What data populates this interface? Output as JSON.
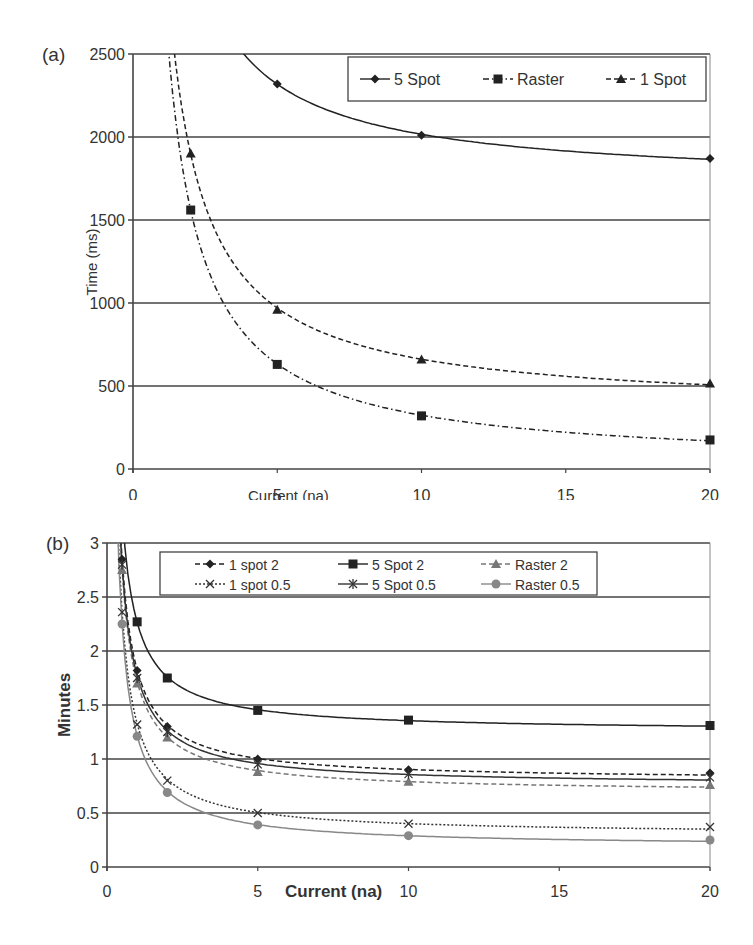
{
  "chart_data": [
    {
      "panel_label": "(a)",
      "type": "line",
      "title": "",
      "xlabel": "Current (na)",
      "ylabel": "Time (ms)",
      "xlim": [
        0,
        20
      ],
      "ylim": [
        0,
        2500
      ],
      "xticks": [
        0,
        5,
        10,
        15,
        20
      ],
      "yticks": [
        0,
        500,
        1000,
        1500,
        2000,
        2500
      ],
      "grid": "horizontal",
      "legend_position": "top-right",
      "series": [
        {
          "name": "5 Spot",
          "marker": "diamond",
          "line": "solid",
          "x": [
            5,
            10,
            20
          ],
          "values": [
            2320,
            2010,
            1870
          ]
        },
        {
          "name": "Raster",
          "marker": "square",
          "line": "dashdot",
          "x": [
            2,
            5,
            10,
            20
          ],
          "values": [
            1560,
            630,
            320,
            175
          ]
        },
        {
          "name": "1 Spot",
          "marker": "triangle",
          "line": "dashed",
          "x": [
            2,
            5,
            10,
            20
          ],
          "values": [
            1900,
            960,
            660,
            515
          ]
        }
      ]
    },
    {
      "panel_label": "(b)",
      "type": "line",
      "title": "",
      "xlabel": "Current (na)",
      "ylabel": "Minutes",
      "xlim": [
        0,
        20
      ],
      "ylim": [
        0,
        3
      ],
      "xticks": [
        0,
        5,
        10,
        15,
        20
      ],
      "yticks": [
        0,
        0.5,
        1,
        1.5,
        2,
        2.5,
        3
      ],
      "grid": "horizontal",
      "legend_position": "top-right",
      "series": [
        {
          "name": "1 spot 2",
          "marker": "diamond",
          "line": "dashed",
          "color": "#222222",
          "x": [
            0.5,
            1,
            2,
            5,
            10,
            20
          ],
          "values": [
            2.85,
            1.82,
            1.3,
            1.0,
            0.9,
            0.87
          ]
        },
        {
          "name": "5 Spot 2",
          "marker": "square",
          "line": "solid",
          "color": "#222222",
          "x": [
            1,
            2,
            5,
            10,
            20
          ],
          "values": [
            2.27,
            1.75,
            1.45,
            1.36,
            1.31
          ]
        },
        {
          "name": "Raster 2",
          "marker": "triangle",
          "line": "dashed",
          "color": "#777777",
          "x": [
            0.5,
            1,
            2,
            5,
            10,
            20
          ],
          "values": [
            2.75,
            1.7,
            1.2,
            0.88,
            0.79,
            0.76
          ]
        },
        {
          "name": "1 spot 0.5",
          "marker": "x",
          "line": "dotted",
          "color": "#333333",
          "x": [
            0.5,
            1,
            2,
            5,
            10,
            20
          ],
          "values": [
            2.36,
            1.32,
            0.8,
            0.5,
            0.4,
            0.37
          ]
        },
        {
          "name": "5 Spot 0.5",
          "marker": "star",
          "line": "solid",
          "color": "#333333",
          "x": [
            0.5,
            1,
            2,
            5,
            10,
            20
          ],
          "values": [
            2.8,
            1.75,
            1.25,
            0.95,
            0.86,
            0.83
          ]
        },
        {
          "name": "Raster 0.5",
          "marker": "circle",
          "line": "solid",
          "color": "#888888",
          "x": [
            0.5,
            1,
            2,
            5,
            10,
            20
          ],
          "values": [
            2.25,
            1.21,
            0.69,
            0.39,
            0.29,
            0.25
          ]
        }
      ]
    }
  ]
}
